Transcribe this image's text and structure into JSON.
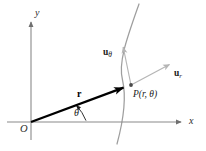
{
  "figure": {
    "kind": "polar-coordinates-unit-vectors-diagram",
    "width": 206,
    "height": 151,
    "background_color": "#ffffff"
  },
  "axes": {
    "x_label": "x",
    "y_label": "y",
    "origin_label": "O",
    "axis_color": "#8a8a8a",
    "origin_px": [
      31,
      122
    ],
    "x_axis_end_px": [
      185,
      122
    ],
    "y_axis_top_px": [
      31,
      18
    ],
    "y_axis_bottom_px": [
      31,
      140
    ]
  },
  "position_vector": {
    "label": "r",
    "color": "#000000",
    "from_px": [
      31,
      122
    ],
    "to_px": [
      131,
      85
    ]
  },
  "angle": {
    "label": "θ",
    "arc_color": "#1a1a1a",
    "vertex_px": [
      31,
      122
    ],
    "arc_radius_px": 48,
    "label_px": [
      77,
      112
    ]
  },
  "point": {
    "label": "P(r, θ)",
    "marker_px": [
      131,
      85
    ],
    "label_px": [
      133,
      92
    ]
  },
  "curve": {
    "name": "coordinate-curve",
    "color": "#9e9e9e",
    "start_px": [
      139,
      4
    ],
    "end_px": [
      117,
      144
    ]
  },
  "unit_vectors": [
    {
      "name": "u-theta",
      "base": "u",
      "subscript": "θ",
      "color": "#b5b5b5",
      "from_px": [
        131,
        85
      ],
      "to_px": [
        122,
        42
      ],
      "label_px": [
        104,
        50
      ]
    },
    {
      "name": "u-r",
      "base": "u",
      "subscript": "r",
      "color": "#b5b5b5",
      "from_px": [
        131,
        85
      ],
      "to_px": [
        174,
        62
      ],
      "label_px": [
        176,
        71
      ]
    }
  ]
}
